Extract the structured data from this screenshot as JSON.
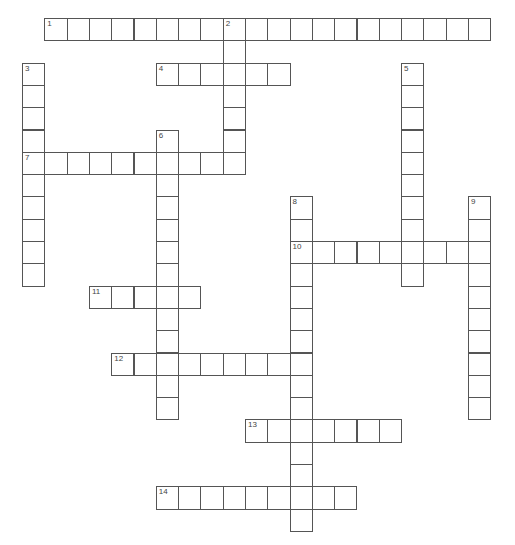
{
  "puzzle": {
    "grid": {
      "origin_x": 22,
      "origin_y": 18,
      "cell_size": 22.3
    },
    "colors": {
      "border": "#555555",
      "cell_background": "#ffffff",
      "number_text": "#444444"
    },
    "entries": [
      {
        "number": "1",
        "direction": "across",
        "col": 1,
        "row": 0,
        "length": 20
      },
      {
        "number": "2",
        "direction": "down",
        "col": 9,
        "row": 0,
        "length": 7
      },
      {
        "number": "3",
        "direction": "down",
        "col": 0,
        "row": 2,
        "length": 10
      },
      {
        "number": "4",
        "direction": "across",
        "col": 6,
        "row": 2,
        "length": 6
      },
      {
        "number": "5",
        "direction": "down",
        "col": 17,
        "row": 2,
        "length": 10
      },
      {
        "number": "6",
        "direction": "down",
        "col": 6,
        "row": 5,
        "length": 13
      },
      {
        "number": "7",
        "direction": "across",
        "col": 0,
        "row": 6,
        "length": 10
      },
      {
        "number": "8",
        "direction": "down",
        "col": 12,
        "row": 8,
        "length": 15
      },
      {
        "number": "9",
        "direction": "down",
        "col": 20,
        "row": 8,
        "length": 10
      },
      {
        "number": "10",
        "direction": "across",
        "col": 12,
        "row": 10,
        "length": 9
      },
      {
        "number": "11",
        "direction": "across",
        "col": 3,
        "row": 12,
        "length": 5
      },
      {
        "number": "12",
        "direction": "across",
        "col": 4,
        "row": 15,
        "length": 9
      },
      {
        "number": "13",
        "direction": "across",
        "col": 10,
        "row": 18,
        "length": 7
      },
      {
        "number": "14",
        "direction": "across",
        "col": 6,
        "row": 21,
        "length": 9
      }
    ]
  }
}
